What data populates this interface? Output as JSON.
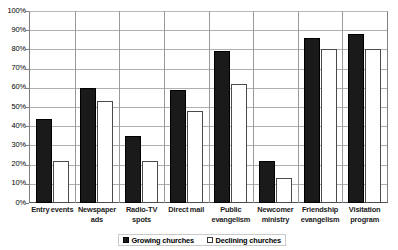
{
  "chart_data": {
    "type": "bar",
    "title": "",
    "subtitle": "",
    "xlabel": "",
    "ylabel": "",
    "ylim": [
      0,
      100
    ],
    "ytick_labels": [
      "100%",
      "90%",
      "80%",
      "70%",
      "60%",
      "50%",
      "40%",
      "30%",
      "20%",
      "10%",
      "0%"
    ],
    "ytick_values": [
      100,
      90,
      80,
      70,
      60,
      50,
      40,
      30,
      20,
      10,
      0
    ],
    "grid": "horizontal",
    "legend_position": "bottom-center",
    "categories": [
      "Entry events",
      "Newspaper ads",
      "Radio-TV spots",
      "Direct mail",
      "Public evangelism",
      "Newcomer ministry",
      "Friendship evangelism",
      "Visitation program"
    ],
    "series": [
      {
        "name": "Growing churches",
        "color": "#1a1a1a",
        "fill": "solid",
        "values": [
          44,
          60,
          35,
          59,
          79,
          22,
          86,
          88
        ]
      },
      {
        "name": "Declining churches",
        "color": "#ffffff",
        "fill": "hollow",
        "values": [
          22,
          53,
          22,
          48,
          62,
          13,
          80,
          80
        ]
      }
    ]
  },
  "legend": {
    "items": [
      {
        "label": "Growing churches",
        "swatch": "filled-square-icon"
      },
      {
        "label": "Declining churches",
        "swatch": "hollow-square-icon"
      }
    ]
  }
}
